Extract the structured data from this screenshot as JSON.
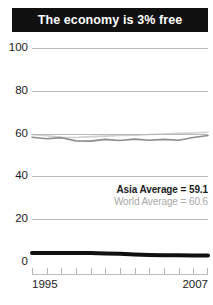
{
  "title": "The economy is 3% free",
  "legend": {
    "asia": "Asia Average = 59.1",
    "world": "World Average = 60.6"
  },
  "axis": {
    "x_start": "1995",
    "x_end": "2007",
    "y_ticks": [
      "100",
      "80",
      "60",
      "40",
      "20",
      "0"
    ]
  },
  "colors": {
    "banner_background": "#101010",
    "banner_text": "#ffffff",
    "gridline": "#b9b9b9",
    "country_line": "#101010",
    "asia_line": "#8c8c8c",
    "world_line": "#cfcfcf",
    "legend_asia_text": "#1c1c1c",
    "legend_world_text": "#a9a9a9",
    "axis_text": "#1a1a1a"
  },
  "chart_data": {
    "type": "line",
    "title": "The economy is 3% free",
    "xlabel": "",
    "ylabel": "",
    "xlim": [
      1995,
      2007
    ],
    "ylim": [
      0,
      100
    ],
    "grid": true,
    "legend_position": "inside-right",
    "x": [
      1995,
      1996,
      1997,
      1998,
      1999,
      2000,
      2001,
      2002,
      2003,
      2004,
      2005,
      2006,
      2007
    ],
    "series": [
      {
        "name": "World Average",
        "label": "World Average = 60.6",
        "color": "#cfcfcf",
        "values": [
          59.6,
          59.0,
          58.3,
          58.2,
          58.6,
          58.8,
          59.1,
          59.3,
          59.6,
          59.8,
          60.1,
          60.3,
          60.6
        ]
      },
      {
        "name": "Asia Average",
        "label": "Asia Average = 59.1",
        "color": "#8c8c8c",
        "values": [
          58.3,
          57.6,
          58.1,
          56.6,
          56.5,
          57.3,
          56.8,
          57.4,
          56.9,
          57.3,
          56.9,
          58.2,
          59.1
        ]
      },
      {
        "name": "Country",
        "label": "The economy is 3% free",
        "color": "#101010",
        "values": [
          4.2,
          4.2,
          4.2,
          4.2,
          4.2,
          4.0,
          3.8,
          3.5,
          3.3,
          3.2,
          3.1,
          3.0,
          3.0
        ]
      }
    ]
  }
}
